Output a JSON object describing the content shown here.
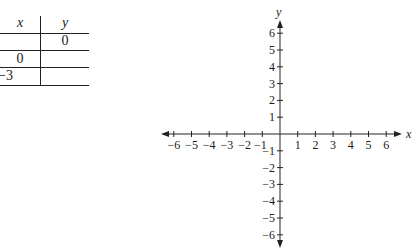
{
  "table": {
    "headers": {
      "x": "x",
      "y": "y"
    },
    "rows": [
      {
        "x": "",
        "y": "0"
      },
      {
        "x": "0",
        "y": ""
      },
      {
        "x": "−3",
        "y": ""
      }
    ]
  },
  "graph": {
    "x_axis_label": "x",
    "y_axis_label": "y",
    "x_ticks": [
      "−6",
      "−5",
      "−4",
      "−3",
      "−2",
      "−1",
      "1",
      "2",
      "3",
      "4",
      "5",
      "6"
    ],
    "y_ticks_positive": [
      "6",
      "5",
      "4",
      "3",
      "2",
      "1"
    ],
    "y_ticks_negative": [
      "−1",
      "−2",
      "−3",
      "−4",
      "−5",
      "−6"
    ]
  }
}
